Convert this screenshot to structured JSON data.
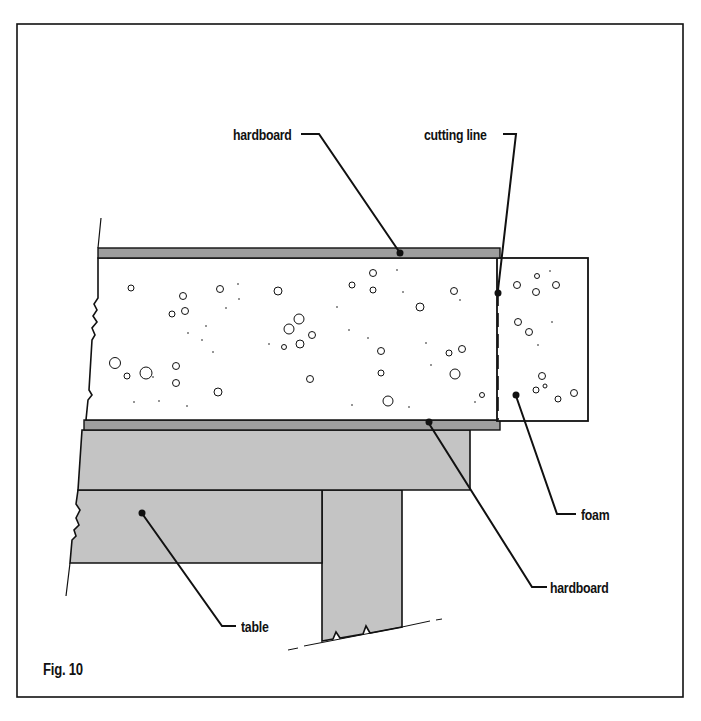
{
  "figure": {
    "caption": "Fig. 10",
    "colors": {
      "board_fill": "#9e9e9e",
      "table_fill": "#c4c4c4",
      "foam_fill": "#ffffff",
      "line": "#111111"
    },
    "labels": {
      "top_hardboard": "hardboard",
      "cutting_line": "cutting line",
      "foam": "foam",
      "bottom_hardboard": "hardboard",
      "table": "table"
    }
  }
}
